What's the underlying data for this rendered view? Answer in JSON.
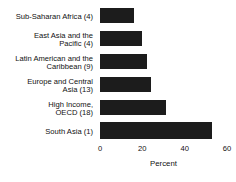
{
  "chart_data": {
    "type": "bar",
    "orientation": "horizontal",
    "title": "",
    "xlabel": "Percent",
    "ylabel": "",
    "xlim": [
      0,
      60
    ],
    "xticks": [
      0,
      20,
      40,
      60
    ],
    "xticklabels": [
      "0",
      "20",
      "40",
      "60"
    ],
    "grid": false,
    "legend": null,
    "bar_color": "#1c1c1c",
    "background_color": "#ffffff",
    "categories": [
      "Sub-Saharan Africa (4)",
      "East Asia and the Pacific (4)",
      "Latin American and the Caribbean (9)",
      "Europe and Central Asia (13)",
      "High Income, OECD (18)",
      "South Asia (1)"
    ],
    "category_lines": [
      [
        "Sub-Saharan Africa (4)"
      ],
      [
        "East Asia and the",
        "Pacific (4)"
      ],
      [
        "Latin American and the",
        "Caribbean (9)"
      ],
      [
        "Europe and Central",
        "Asia (13)"
      ],
      [
        "High Income,",
        "OECD (18)"
      ],
      [
        "South Asia (1)"
      ]
    ],
    "values": [
      16,
      20,
      22,
      24,
      31,
      53
    ]
  }
}
